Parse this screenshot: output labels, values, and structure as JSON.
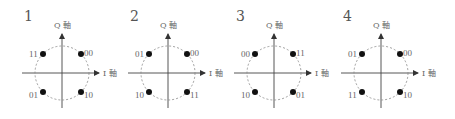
{
  "diagrams": [
    {
      "number": "1",
      "axis_q": "Q 軸",
      "axis_i": "I 軸",
      "points": {
        "top_left": "11",
        "top_right": "00",
        "bottom_left": "01",
        "bottom_right": "10"
      }
    },
    {
      "number": "2",
      "axis_q": "Q 軸",
      "axis_i": "I 軸",
      "points": {
        "top_left": "01",
        "top_right": "00",
        "bottom_left": "10",
        "bottom_right": "11"
      }
    },
    {
      "number": "3",
      "axis_q": "Q 軸",
      "axis_i": "I 軸",
      "points": {
        "top_left": "00",
        "top_right": "11",
        "bottom_left": "10",
        "bottom_right": "01"
      }
    },
    {
      "number": "4",
      "axis_q": "Q 軸",
      "axis_i": "I 軸",
      "points": {
        "top_left": "01",
        "top_right": "00",
        "bottom_left": "11",
        "bottom_right": "10"
      }
    }
  ],
  "colors": {
    "axis": "#444444",
    "circle": "#888888",
    "dot": "#111111",
    "text": "#555555"
  }
}
